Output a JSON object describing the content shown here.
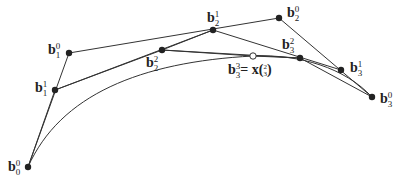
{
  "diagram": {
    "type": "de Casteljau subdivision of a cubic Bezier curve",
    "colors": {
      "line": "#333333",
      "point": "#222222",
      "open_point_fill": "#ffffff"
    },
    "points": [
      {
        "id": "b00",
        "base": "b",
        "sub": "0",
        "sup": "0",
        "x": 28,
        "y": 167,
        "filled": true
      },
      {
        "id": "b10",
        "base": "b",
        "sub": "1",
        "sup": "0",
        "x": 69,
        "y": 53,
        "filled": true
      },
      {
        "id": "b11",
        "base": "b",
        "sub": "1",
        "sup": "1",
        "x": 55,
        "y": 90,
        "filled": true
      },
      {
        "id": "b22",
        "base": "b",
        "sub": "2",
        "sup": "2",
        "x": 162,
        "y": 50,
        "filled": true
      },
      {
        "id": "b21",
        "base": "b",
        "sub": "2",
        "sup": "1",
        "x": 213,
        "y": 30,
        "filled": true
      },
      {
        "id": "b20",
        "base": "b",
        "sub": "2",
        "sup": "0",
        "x": 279,
        "y": 18,
        "filled": true
      },
      {
        "id": "b33",
        "base": "b",
        "sub": "3",
        "sup": "3",
        "x": 253,
        "y": 56,
        "filled": false
      },
      {
        "id": "b32",
        "base": "b",
        "sub": "3",
        "sup": "2",
        "x": 300,
        "y": 58,
        "filled": true
      },
      {
        "id": "b31",
        "base": "b",
        "sub": "3",
        "sup": "1",
        "x": 341,
        "y": 70,
        "filled": true
      },
      {
        "id": "b30",
        "base": "b",
        "sub": "3",
        "sup": "0",
        "x": 372,
        "y": 97,
        "filled": true
      }
    ],
    "labels": {
      "b10": {
        "base": "b",
        "sup": "0",
        "sub": "1"
      },
      "b11": {
        "base": "b",
        "sup": "1",
        "sub": "1"
      },
      "b00": {
        "base": "b",
        "sup": "0",
        "sub": "0"
      },
      "b22": {
        "base": "b",
        "sup": "2",
        "sub": "2"
      },
      "b21": {
        "base": "b",
        "sup": "1",
        "sub": "2"
      },
      "b20": {
        "base": "b",
        "sup": "0",
        "sub": "2"
      },
      "b32": {
        "base": "b",
        "sup": "2",
        "sub": "3"
      },
      "b31": {
        "base": "b",
        "sup": "1",
        "sub": "3"
      },
      "b30": {
        "base": "b",
        "sup": "0",
        "sub": "3"
      },
      "b33": {
        "base": "b",
        "sup": "3",
        "sub": "3",
        "eq": "= x(",
        "num": "2",
        "den": "3",
        "close": ")"
      }
    }
  }
}
